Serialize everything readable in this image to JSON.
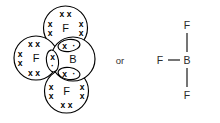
{
  "figure": {
    "connector_label": "or",
    "background_color": "#ffffff",
    "line_color": "#000000",
    "structural_line_color": "#2b2b2b"
  },
  "dot_cross_model": {
    "description": "Dot-and-cross diagram of BF3 showing overlapping outer shells",
    "central_atom": {
      "symbol": "B",
      "cx": 73,
      "cy": 59,
      "r": 22
    },
    "outer_atoms": [
      {
        "symbol": "F",
        "position": "top",
        "cx": 65.5,
        "cy": 28,
        "r": 22
      },
      {
        "symbol": "F",
        "position": "left",
        "cx": 36,
        "cy": 58,
        "r": 22
      },
      {
        "symbol": "F",
        "position": "bottom",
        "cx": 66.5,
        "cy": 91,
        "r": 22
      }
    ],
    "lone_pair_groups": {
      "top_fluorine": [
        {
          "glyph": "x x",
          "x": 65.5,
          "y": 13.5,
          "rot": 0
        },
        {
          "glyph": "x",
          "x": 50,
          "y": 24,
          "rot": 0
        },
        {
          "glyph": "x",
          "x": 50,
          "y": 33,
          "rot": 0
        },
        {
          "glyph": "x",
          "x": 81,
          "y": 24,
          "rot": 0
        },
        {
          "glyph": "x",
          "x": 81,
          "y": 33,
          "rot": 0
        }
      ],
      "left_fluorine": [
        {
          "glyph": "x x",
          "x": 34,
          "y": 44,
          "rot": 0
        },
        {
          "glyph": "x",
          "x": 20,
          "y": 54,
          "rot": 0
        },
        {
          "glyph": "x",
          "x": 20,
          "y": 63,
          "rot": 0
        },
        {
          "glyph": "x x",
          "x": 34,
          "y": 73,
          "rot": 0
        }
      ],
      "bottom_fluorine": [
        {
          "glyph": "x",
          "x": 51,
          "y": 87,
          "rot": 0
        },
        {
          "glyph": "x",
          "x": 51,
          "y": 96,
          "rot": 0
        },
        {
          "glyph": "x",
          "x": 82,
          "y": 87,
          "rot": 0
        },
        {
          "glyph": "x",
          "x": 82,
          "y": 96,
          "rot": 0
        },
        {
          "glyph": "x x",
          "x": 66.5,
          "y": 105,
          "rot": 0
        }
      ]
    },
    "shared_pairs": [
      {
        "name": "top-bond-pair",
        "cx": 69,
        "cy": 45.5,
        "rx": 11,
        "ry": 6,
        "rot": -8,
        "cross": {
          "glyph": "x",
          "x": 64.5,
          "y": 45.5
        },
        "dot": {
          "glyph": "·",
          "x": 74,
          "y": 45.5
        }
      },
      {
        "name": "left-bond-pair",
        "cx": 52.5,
        "cy": 61,
        "rx": 11,
        "ry": 6,
        "rot": 82,
        "cross": {
          "glyph": "x",
          "x": 52.5,
          "y": 56.5
        },
        "dot": {
          "glyph": "·",
          "x": 52.5,
          "y": 65.5
        }
      },
      {
        "name": "bottom-bond-pair",
        "cx": 69,
        "cy": 73.5,
        "rx": 11,
        "ry": 6,
        "rot": 8,
        "cross": {
          "glyph": "x",
          "x": 64.5,
          "y": 73.5
        },
        "dot": {
          "glyph": "·",
          "x": 74,
          "y": 73.5
        }
      }
    ]
  },
  "connector": {
    "label": "or",
    "x": 120,
    "y": 60
  },
  "structural_formula": {
    "description": "Structural formula of BF3 with three single bonds",
    "center": {
      "symbol": "B",
      "x": 187,
      "y": 60
    },
    "substituents": [
      {
        "symbol": "F",
        "position": "top",
        "x": 187,
        "y": 25
      },
      {
        "symbol": "F",
        "position": "left",
        "x": 160,
        "y": 60
      },
      {
        "symbol": "F",
        "position": "bottom",
        "x": 187,
        "y": 95
      }
    ],
    "bonds": [
      {
        "name": "bond-top",
        "x1": 187,
        "y1": 33,
        "x2": 187,
        "y2": 52
      },
      {
        "name": "bond-left",
        "x1": 168,
        "y1": 60,
        "x2": 180,
        "y2": 60
      },
      {
        "name": "bond-bottom",
        "x1": 187,
        "y1": 68,
        "x2": 187,
        "y2": 87
      }
    ]
  }
}
